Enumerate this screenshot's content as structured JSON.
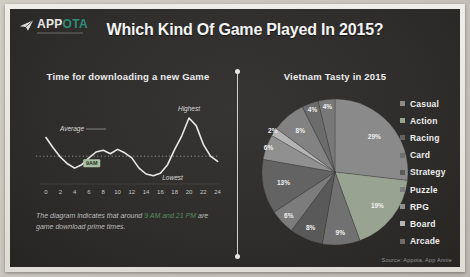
{
  "page": {
    "header": {
      "logo": {
        "app": "APP",
        "ota": "OTA"
      },
      "title": "Which Kind Of Game Played In 2015?"
    },
    "left_panel": {
      "title": "Time for downloading a new Game",
      "caption": {
        "prefix": "The diagram indicates that around ",
        "highlight": "9 AM and 21 PM",
        "suffix": " are game download prime times."
      }
    },
    "right_panel": {
      "title": "Vietnam Tasty in 2015",
      "source": "Source: Appota, App Annie"
    },
    "colors": {
      "panel_bg": "#2e2d2b",
      "accent_teal": "#2e8c79",
      "caption_highlight": "#5d8a63",
      "line_color": "#e8e8e8"
    }
  },
  "chart_data": [
    {
      "type": "line",
      "title": "Time for downloading a new Game",
      "xlabel": "hour of day (0-24)",
      "ylabel": "game downloads (relative level)",
      "xlim": [
        0,
        24
      ],
      "grid": false,
      "x": [
        0,
        1,
        2,
        3,
        4,
        5,
        6,
        7,
        8,
        9,
        10,
        11,
        12,
        13,
        14,
        15,
        16,
        17,
        18,
        19,
        20,
        21,
        22,
        23,
        24
      ],
      "y": [
        50,
        38,
        27,
        19,
        14,
        18,
        26,
        33,
        35,
        31,
        36,
        32,
        26,
        14,
        7,
        5,
        8,
        18,
        36,
        52,
        73,
        64,
        42,
        28,
        22
      ],
      "x_tick_labels": [
        "0",
        "2",
        "4",
        "6",
        "8",
        "10",
        "12",
        "14",
        "16",
        "18",
        "20",
        "22",
        "24"
      ],
      "average_level": 60,
      "guide_level": 28,
      "highest_at_hour": 20,
      "lowest_at_hour": 15,
      "annotations": {
        "average": "Average",
        "highest": "Highest",
        "lowest": "Lowest",
        "badge": "9AM"
      }
    },
    {
      "type": "pie",
      "title": "Vietnam Tasty in 2015",
      "legend_position": "right",
      "legend": [
        {
          "label": "Casual",
          "color": "#8a8a8a"
        },
        {
          "label": "Action",
          "color": "#99a391"
        },
        {
          "label": "Racing",
          "color": "#636363"
        },
        {
          "label": "Card",
          "color": "#717171"
        },
        {
          "label": "Strategy",
          "color": "#595959"
        },
        {
          "label": "Puzzle",
          "color": "#7c7c7c"
        },
        {
          "label": "RPG",
          "color": "#909090"
        },
        {
          "label": "Board",
          "color": "#b5b5b5"
        },
        {
          "label": "Arcade",
          "color": "#6c6c6c"
        }
      ],
      "slices_clockwise_from_top": [
        {
          "pct": 29,
          "color": "#8a8a8a",
          "lr": 0.72
        },
        {
          "pct": 19,
          "color": "#99a391",
          "lr": 0.74
        },
        {
          "pct": 9,
          "color": "#717171",
          "lr": 0.84
        },
        {
          "pct": 8,
          "color": "#595959",
          "lr": 0.84
        },
        {
          "pct": 6,
          "color": "#7c7c7c",
          "lr": 0.87
        },
        {
          "pct": 13,
          "color": "#636363",
          "lr": 0.72
        },
        {
          "pct": 6,
          "color": "#909090",
          "lr": 0.97
        },
        {
          "pct": 2,
          "color": "#b5b5b5",
          "lr": 1.02
        },
        {
          "pct": 8,
          "color": "#828282",
          "lr": 0.74
        },
        {
          "pct": 4,
          "color": "#6c6c6c",
          "lr": 0.9
        },
        {
          "pct": 4,
          "color": "#787878",
          "lr": 0.9
        }
      ]
    }
  ]
}
